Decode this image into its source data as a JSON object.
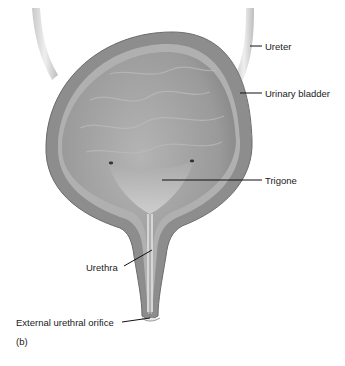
{
  "figure": {
    "panel_label": "(b)",
    "labels": {
      "ureter": "Ureter",
      "urinary_bladder": "Urinary bladder",
      "trigone": "Trigone",
      "urethra": "Urethra",
      "external_urethral_orifice": "External urethral orifice"
    },
    "colors": {
      "background": "#ffffff",
      "wall_outer": "#8f8f8f",
      "wall_layer": "#b5b5b5",
      "lumen": "#9e9e9e",
      "ureter": "#d8d8d8",
      "leader_line": "#111111",
      "text": "#1a1a1a"
    }
  }
}
